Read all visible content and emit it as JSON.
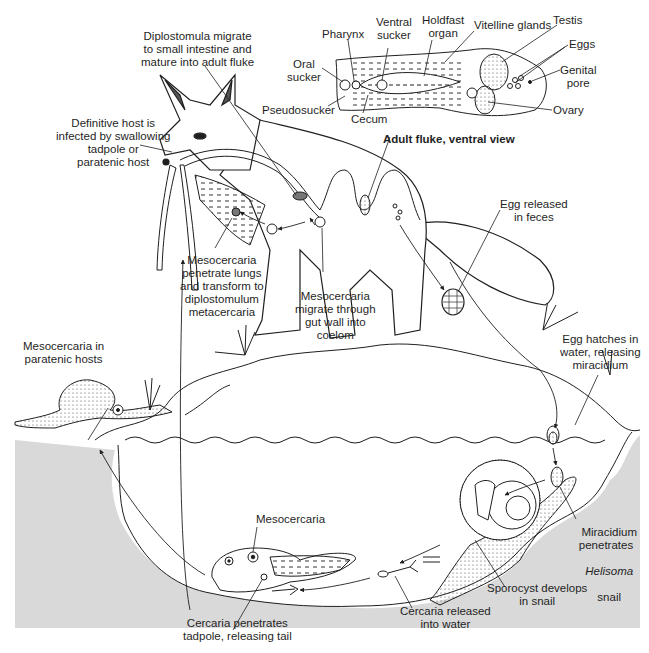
{
  "diagram": {
    "type": "life-cycle",
    "colors": {
      "ink": "#1f1f1f",
      "water_gray": "#d9d9d9",
      "background": "#ffffff"
    },
    "adult_fluke_inset": {
      "caption": "Adult fluke, ventral view",
      "parts": {
        "pharynx": "Pharynx",
        "ventral_sucker": "Ventral\nsucker",
        "holdfast_organ": "Holdfast\norgan",
        "vitelline_glands": "Vitelline glands",
        "testis": "Testis",
        "eggs": "Eggs",
        "genital_pore": "Genital\npore",
        "oral_sucker": "Oral\nsucker",
        "pseudosucker": "Pseudosucker",
        "cecum": "Cecum",
        "ovary": "Ovary"
      }
    },
    "stages": {
      "diplostomula_migrate": "Diplostomula migrate\nto small intestine and\nmature into adult fluke",
      "definitive_host": "Definitive host is\ninfected by swallowing\ntadpole or\nparatenic host",
      "mesocercaria_lungs": "Mesocercaria\npenetrate lungs\nand transform to\ndiplostomulum\nmetacercaria",
      "mesocercaria_gut": "Mesocercaria\nmigrate through\ngut wall into\ncoelom",
      "egg_released": "Egg released\nin feces",
      "egg_hatches": "Egg hatches in\nwater, releasing\nmiracidium",
      "paratenic": "Mesocercaria in\nparatenic hosts",
      "mesocercaria": "Mesocercaria",
      "miracidium_penetrates_1": "Miracidium\npenetrates",
      "miracidium_penetrates_genus": "Helisoma",
      "miracidium_penetrates_2": "snail",
      "sporocyst": "Sporocyst develops\nin snail",
      "cercaria_released": "Cercaria released\ninto water",
      "cercaria_penetrates": "Cercaria penetrates\ntadpole, releasing tail"
    }
  }
}
